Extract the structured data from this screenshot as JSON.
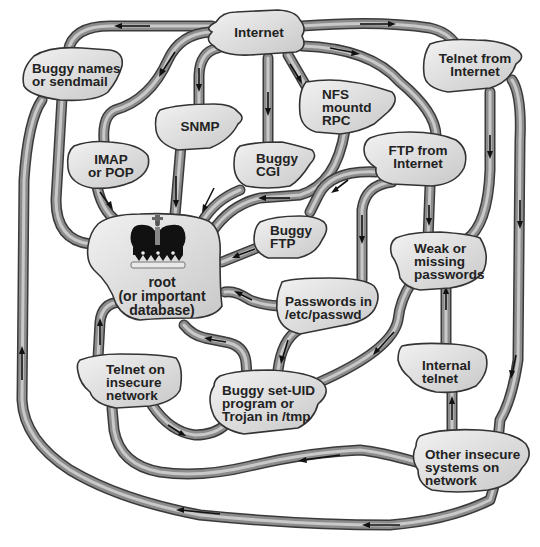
{
  "diagram": {
    "nodes": {
      "internet": {
        "label": "Internet"
      },
      "buggy_names": {
        "label": "Buggy names\nor sendmail"
      },
      "telnet_internet": {
        "label": "Telnet from\nInternet"
      },
      "nfs": {
        "label": "NFS\nmountd\nRPC"
      },
      "snmp": {
        "label": "SNMP"
      },
      "imap": {
        "label": "IMAP\nor POP"
      },
      "buggy_cgi": {
        "label": "Buggy\nCGI"
      },
      "ftp_internet": {
        "label": "FTP from\nInternet"
      },
      "buggy_ftp": {
        "label": "Buggy\nFTP"
      },
      "root": {
        "label": "root\n(or important\ndatabase)",
        "icon": "crown-icon"
      },
      "weak_passwords": {
        "label": "Weak or\nmissing\npasswords"
      },
      "passwords_etc": {
        "label": "Passwords in\n/etc/passwd"
      },
      "telnet_insecure": {
        "label": "Telnet on\ninsecure\nnetwork"
      },
      "buggy_setuid": {
        "label": "Buggy set-UID\nprogram or\nTrojan in /tmp"
      },
      "internal_telnet": {
        "label": "Internal\ntelnet"
      },
      "other_systems": {
        "label": "Other insecure\nsystems on\nnetwork"
      }
    },
    "edges": [
      {
        "from": "Internet",
        "to": "Buggy names or sendmail"
      },
      {
        "from": "Internet",
        "to": "IMAP or POP"
      },
      {
        "from": "Internet",
        "to": "SNMP"
      },
      {
        "from": "Internet",
        "to": "Buggy CGI"
      },
      {
        "from": "Internet",
        "to": "NFS mountd RPC"
      },
      {
        "from": "Internet",
        "to": "Telnet from Internet"
      },
      {
        "from": "Internet",
        "to": "FTP from Internet"
      },
      {
        "from": "Buggy names or sendmail",
        "to": "root"
      },
      {
        "from": "IMAP or POP",
        "to": "root"
      },
      {
        "from": "SNMP",
        "to": "root"
      },
      {
        "from": "Buggy CGI",
        "to": "root"
      },
      {
        "from": "NFS mountd RPC",
        "to": "root"
      },
      {
        "from": "FTP from Internet",
        "to": "Buggy FTP"
      },
      {
        "from": "FTP from Internet",
        "to": "Passwords in /etc/passwd"
      },
      {
        "from": "FTP from Internet",
        "to": "Weak or missing passwords"
      },
      {
        "from": "Buggy FTP",
        "to": "root"
      },
      {
        "from": "Telnet from Internet",
        "to": "Weak or missing passwords"
      },
      {
        "from": "Telnet from Internet",
        "to": "Other insecure systems on network"
      },
      {
        "from": "Passwords in /etc/passwd",
        "to": "root"
      },
      {
        "from": "Passwords in /etc/passwd",
        "to": "Buggy set-UID program or Trojan in /tmp"
      },
      {
        "from": "Weak or missing passwords",
        "to": "Buggy set-UID program or Trojan in /tmp"
      },
      {
        "from": "Buggy set-UID program or Trojan in /tmp",
        "to": "root"
      },
      {
        "from": "Telnet on insecure network",
        "to": "root"
      },
      {
        "from": "Telnet on insecure network",
        "to": "Buggy set-UID program or Trojan in /tmp"
      },
      {
        "from": "Internal telnet",
        "to": "Weak or missing passwords"
      },
      {
        "from": "Other insecure systems on network",
        "to": "Internal telnet"
      },
      {
        "from": "Other insecure systems on network",
        "to": "Telnet on insecure network"
      },
      {
        "from": "Other insecure systems on network",
        "to": "root"
      }
    ]
  }
}
